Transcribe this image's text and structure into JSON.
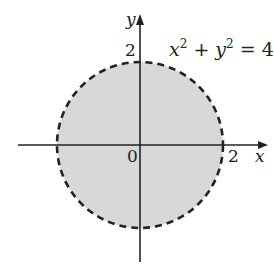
{
  "figure": {
    "equation": {
      "x_term": "x",
      "x_exp": "2",
      "plus": " + ",
      "y_term": "y",
      "y_exp": "2",
      "rhs": " = 4"
    },
    "axes": {
      "x_label": "x",
      "y_label": "y",
      "origin_label": "0",
      "x_tick_label": "2",
      "y_tick_label": "2"
    },
    "circle": {
      "radius": 2,
      "boundary_style": "dashed",
      "fill_color": "#d8d8d8",
      "stroke_color": "#222222"
    },
    "axis_color": "#222222"
  }
}
